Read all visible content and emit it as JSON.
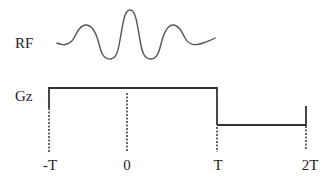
{
  "diagram": {
    "channels": [
      {
        "id": "rf",
        "label": "RF",
        "waveform": "sinc pulse"
      },
      {
        "id": "gz",
        "label": "Gz",
        "waveform": "slice-select gradient with rephasing lobe"
      }
    ],
    "time_axis": {
      "ticks": [
        {
          "label": "-T"
        },
        {
          "label": "0"
        },
        {
          "label": "T"
        },
        {
          "label": "2T"
        }
      ]
    },
    "colors": {
      "line": "#333333",
      "background": "#ffffff"
    }
  }
}
